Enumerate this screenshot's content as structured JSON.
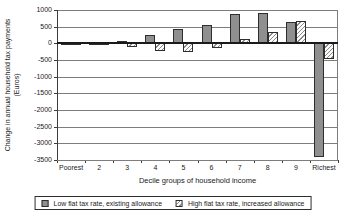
{
  "chart_data": {
    "type": "bar",
    "title": "",
    "categories": [
      "Poorest",
      "2",
      "3",
      "4",
      "5",
      "6",
      "7",
      "8",
      "9",
      "Richest"
    ],
    "series": [
      {
        "name": "Low flat tax rate, existing allowance",
        "style": "solid-gray",
        "values": [
          -5,
          10,
          70,
          240,
          430,
          550,
          870,
          900,
          630,
          -3400
        ]
      },
      {
        "name": "High flat tax rate, increased allowance",
        "style": "diagonal-hatch",
        "values": [
          -10,
          -40,
          -110,
          -230,
          -250,
          -140,
          120,
          340,
          670,
          -480
        ]
      }
    ],
    "xlabel": "Decile groups of household income",
    "ylabel": "Change in annual household tax payments (Euros)",
    "ylabel_lines": [
      "Change in annual household tax payments",
      "(Euros)"
    ],
    "ylim": [
      -3500,
      1000
    ],
    "ytick_step": 500,
    "yticks": [
      "1000",
      "500",
      "0",
      "-500",
      "-1000",
      "-1500",
      "-2000",
      "-2500",
      "-3000",
      "-3500"
    ],
    "grid": true,
    "legend_position": "bottom",
    "colors": {
      "series1_fill": "#8f8f8f",
      "series2_hatch": "#8a8a8a",
      "gridline": "#7d7d7d",
      "zero_line": "#1a1a1a",
      "axis": "#3c3c3c",
      "text": "#1a1a1a",
      "background": "#ffffff"
    }
  }
}
